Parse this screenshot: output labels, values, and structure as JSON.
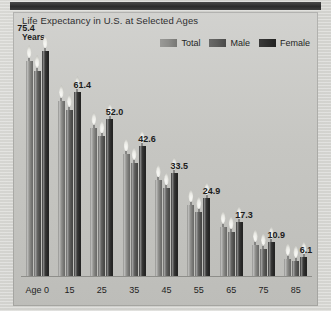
{
  "chart_data": {
    "type": "bar",
    "title": "Life Expectancy in U.S. at Selected Ages",
    "ylabel": "Years",
    "xlabel": "",
    "categories": [
      "Age 0",
      "15",
      "25",
      "35",
      "45",
      "55",
      "65",
      "75",
      "85"
    ],
    "value_labels": [
      "75.4",
      "61.4",
      "52.0",
      "42.6",
      "33.5",
      "24.9",
      "17.3",
      "10.9",
      "6.1"
    ],
    "values": [
      75.4,
      61.4,
      52.0,
      42.6,
      33.5,
      24.9,
      17.3,
      10.9,
      6.1
    ],
    "ylim": [
      0,
      82
    ],
    "grid": false,
    "legend_position": "top-right",
    "series": [
      {
        "name": "Total",
        "color": "#8d8d8a",
        "values": [
          75.4,
          61.4,
          52.0,
          42.6,
          33.5,
          24.9,
          17.3,
          10.9,
          6.1
        ]
      },
      {
        "name": "Male",
        "color": "#5d5d5b",
        "values": [
          72.0,
          58.2,
          48.9,
          39.7,
          30.7,
          22.4,
          15.4,
          9.6,
          5.3
        ]
      },
      {
        "name": "Female",
        "color": "#2e2e2d",
        "values": [
          78.8,
          64.6,
          55.0,
          45.5,
          36.2,
          27.2,
          19.0,
          11.9,
          6.5
        ]
      }
    ]
  },
  "colors": {
    "total": "#8d8d8a",
    "male": "#5d5d5b",
    "female": "#2e2e2d",
    "panel_bg": "#c9c9c5",
    "axis": "#8e8e8a",
    "text": "#1f1f1f"
  }
}
